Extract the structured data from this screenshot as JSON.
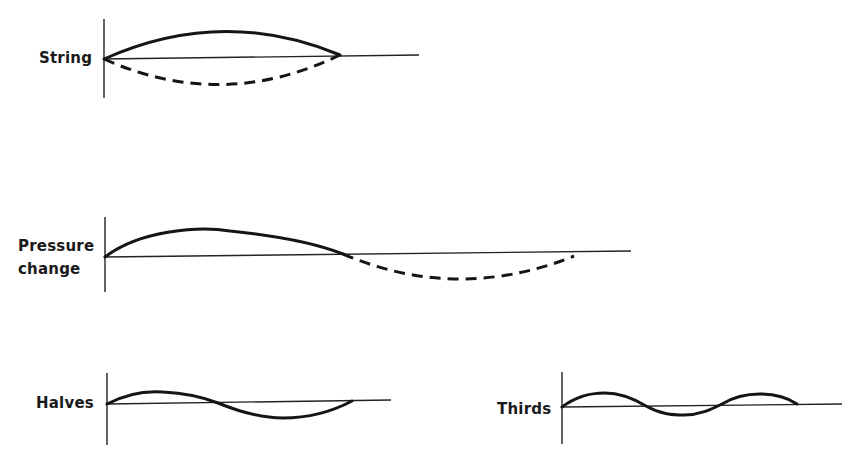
{
  "diagram": {
    "panels": [
      {
        "id": "string",
        "label": "String",
        "description": "Fundamental vibration of a string fixed at both ends; solid upper arc and dashed lower arc show opposite extremes of displacement"
      },
      {
        "id": "pressure",
        "label_line1": "Pressure",
        "label_line2": "change",
        "description": "Pressure variation: solid positive half-wave followed by dashed negative half-wave"
      },
      {
        "id": "halves",
        "label": "Halves",
        "description": "Second harmonic: string vibrating in two segments"
      },
      {
        "id": "thirds",
        "label": "Thirds",
        "description": "Third harmonic: string vibrating in three segments"
      }
    ],
    "colors": {
      "ink": "#151515",
      "background": "#ffffff"
    }
  }
}
